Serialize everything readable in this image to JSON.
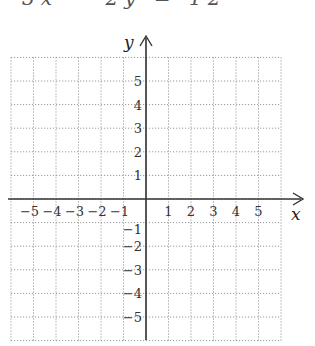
{
  "header": {
    "equation_clipped": "3x − 2y = 12"
  },
  "chart_data": {
    "type": "scatter",
    "title": "",
    "xlabel": "x",
    "ylabel": "y",
    "xlim": [
      -6,
      6
    ],
    "ylim": [
      -6,
      6
    ],
    "grid": true,
    "grid_style": "dotted",
    "x_ticks": [
      -5,
      -4,
      -3,
      -2,
      -1,
      1,
      2,
      3,
      4,
      5
    ],
    "y_ticks": [
      -5,
      -4,
      -3,
      -2,
      -1,
      1,
      2,
      3,
      4,
      5
    ],
    "series": []
  },
  "axes": {
    "x_label": "x",
    "y_label": "y",
    "x_tick_labels": [
      "−5",
      "−4",
      "−3",
      "−2",
      "−1",
      "1",
      "2",
      "3",
      "4",
      "5"
    ],
    "y_tick_labels": [
      "5",
      "4",
      "3",
      "2",
      "1",
      "−1",
      "−2",
      "−3",
      "−4",
      "−5"
    ]
  },
  "colors": {
    "grid": "#9a9a9a",
    "axis": "#333333",
    "text": "#333333"
  }
}
